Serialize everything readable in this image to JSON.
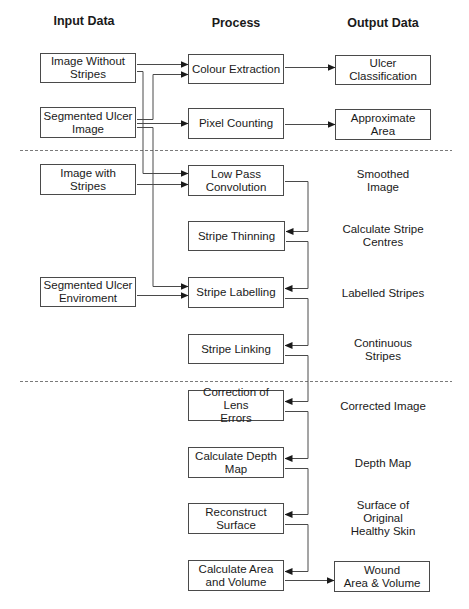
{
  "colors": {
    "line": "#4a4a4a",
    "text": "#1a1a1a",
    "dash": "#7a7a7a"
  },
  "headers": [
    {
      "id": "input",
      "text": "Input Data",
      "x": 84,
      "y": 22
    },
    {
      "id": "process",
      "text": "Process",
      "x": 236,
      "y": 24
    },
    {
      "id": "output",
      "text": "Output Data",
      "x": 383,
      "y": 24
    }
  ],
  "boxes": [
    {
      "id": "image-without-stripes",
      "col": "input",
      "text": "Image Without\nStripes",
      "x": 40,
      "y": 53,
      "w": 96,
      "h": 30
    },
    {
      "id": "segmented-ulcer-image",
      "col": "input",
      "text": "Segmented Ulcer\nImage",
      "x": 40,
      "y": 107,
      "w": 96,
      "h": 31
    },
    {
      "id": "image-with-stripes",
      "col": "input",
      "text": "Image with Stripes",
      "x": 40,
      "y": 164,
      "w": 96,
      "h": 31
    },
    {
      "id": "segmented-ulcer-enviroment",
      "col": "input",
      "text": "Segmented Ulcer\nEnviroment",
      "x": 40,
      "y": 277,
      "w": 96,
      "h": 30
    },
    {
      "id": "colour-extraction",
      "col": "process",
      "text": "Colour Extraction",
      "x": 188,
      "y": 54,
      "w": 96,
      "h": 30
    },
    {
      "id": "pixel-counting",
      "col": "process",
      "text": "Pixel Counting",
      "x": 188,
      "y": 108,
      "w": 96,
      "h": 31
    },
    {
      "id": "low-pass-convolution",
      "col": "process",
      "text": "Low Pass\nConvolution",
      "x": 188,
      "y": 165,
      "w": 96,
      "h": 31
    },
    {
      "id": "stripe-thinning",
      "col": "process",
      "text": "Stripe Thinning",
      "x": 188,
      "y": 221,
      "w": 97,
      "h": 30
    },
    {
      "id": "stripe-labelling",
      "col": "process",
      "text": "Stripe Labelling",
      "x": 188,
      "y": 277,
      "w": 96,
      "h": 31
    },
    {
      "id": "stripe-linking",
      "col": "process",
      "text": "Stripe Linking",
      "x": 188,
      "y": 334,
      "w": 96,
      "h": 30
    },
    {
      "id": "correction-of-lens-errors",
      "col": "process",
      "text": "Correction of Lens\nErrors",
      "x": 188,
      "y": 390,
      "w": 96,
      "h": 31
    },
    {
      "id": "calculate-depth-map",
      "col": "process",
      "text": "Calculate Depth\nMap",
      "x": 188,
      "y": 447,
      "w": 96,
      "h": 31
    },
    {
      "id": "reconstruct-surface",
      "col": "process",
      "text": "Reconstruct\nSurface",
      "x": 188,
      "y": 503,
      "w": 96,
      "h": 31
    },
    {
      "id": "calculate-area-and-volume",
      "col": "process",
      "text": "Calculate Area\nand Volume",
      "x": 188,
      "y": 560,
      "w": 96,
      "h": 31
    },
    {
      "id": "ulcer-classification",
      "col": "output",
      "text": "Ulcer Classification",
      "x": 335,
      "y": 55,
      "w": 96,
      "h": 30
    },
    {
      "id": "approximate-area",
      "col": "output",
      "text": "Approximate Area",
      "x": 335,
      "y": 109,
      "w": 96,
      "h": 31
    },
    {
      "id": "wound-area-volume",
      "col": "output",
      "text": "Wound\nArea & Volume",
      "x": 334,
      "y": 561,
      "w": 96,
      "h": 31
    }
  ],
  "labels": [
    {
      "id": "smoothed-image",
      "text": "Smoothed Image",
      "x": 383,
      "y": 181
    },
    {
      "id": "calculate-stripe-centres",
      "text": "Calculate Stripe\nCentres",
      "x": 383,
      "y": 236
    },
    {
      "id": "labelled-stripes",
      "text": "Labelled Stripes",
      "x": 383,
      "y": 293
    },
    {
      "id": "continuous-stripes",
      "text": "Continuous Stripes",
      "x": 383,
      "y": 350
    },
    {
      "id": "corrected-image",
      "text": "Corrected Image",
      "x": 383,
      "y": 406
    },
    {
      "id": "depth-map",
      "text": "Depth Map",
      "x": 383,
      "y": 463
    },
    {
      "id": "surface-of-original-healthy-skin",
      "text": "Surface of Original\nHealthy Skin",
      "x": 383,
      "y": 518
    }
  ],
  "dividers": [
    {
      "id": "divider-1",
      "x1": 20,
      "x2": 452,
      "y": 150
    },
    {
      "id": "divider-2",
      "x1": 20,
      "x2": 452,
      "y": 381
    }
  ],
  "connectors": [
    {
      "id": "iws-to-colour",
      "points": [
        [
          137,
          64
        ],
        [
          188,
          64
        ]
      ],
      "arrow": true
    },
    {
      "id": "iws-to-lowpass",
      "points": [
        [
          137,
          71
        ],
        [
          143,
          71
        ],
        [
          143,
          173
        ],
        [
          188,
          173
        ]
      ],
      "arrow": true
    },
    {
      "id": "sui-to-colour",
      "points": [
        [
          137,
          119
        ],
        [
          153,
          119
        ],
        [
          153,
          74
        ],
        [
          188,
          74
        ]
      ],
      "arrow": true
    },
    {
      "id": "sui-to-pixel",
      "points": [
        [
          137,
          123
        ],
        [
          188,
          123
        ]
      ],
      "arrow": true
    },
    {
      "id": "sui-to-labelling",
      "points": [
        [
          137,
          127
        ],
        [
          153,
          127
        ],
        [
          153,
          286
        ],
        [
          188,
          286
        ]
      ],
      "arrow": true
    },
    {
      "id": "iwstripes-to-lowpass",
      "points": [
        [
          137,
          184
        ],
        [
          188,
          184
        ]
      ],
      "arrow": true
    },
    {
      "id": "sue-to-labelling",
      "points": [
        [
          137,
          295
        ],
        [
          188,
          295
        ]
      ],
      "arrow": true
    },
    {
      "id": "colour-to-classification",
      "points": [
        [
          285,
          67
        ],
        [
          335,
          67
        ]
      ],
      "arrow": true
    },
    {
      "id": "pixel-to-area",
      "points": [
        [
          285,
          124
        ],
        [
          335,
          124
        ]
      ],
      "arrow": true
    },
    {
      "id": "lowpass-to-thinning",
      "points": [
        [
          285,
          181
        ],
        [
          308,
          181
        ],
        [
          308,
          231
        ],
        [
          286,
          231
        ]
      ],
      "arrow": true
    },
    {
      "id": "thinning-to-labelling",
      "points": [
        [
          286,
          241
        ],
        [
          308,
          241
        ],
        [
          308,
          288
        ],
        [
          285,
          288
        ]
      ],
      "arrow": true
    },
    {
      "id": "labelling-to-linking",
      "points": [
        [
          285,
          298
        ],
        [
          308,
          298
        ],
        [
          308,
          345
        ],
        [
          285,
          345
        ]
      ],
      "arrow": true
    },
    {
      "id": "linking-to-correction",
      "points": [
        [
          285,
          355
        ],
        [
          308,
          355
        ],
        [
          308,
          401
        ],
        [
          285,
          401
        ]
      ],
      "arrow": true
    },
    {
      "id": "correction-to-depth",
      "points": [
        [
          285,
          411
        ],
        [
          308,
          411
        ],
        [
          308,
          458
        ],
        [
          285,
          458
        ]
      ],
      "arrow": true
    },
    {
      "id": "depth-to-reconstruct",
      "points": [
        [
          285,
          468
        ],
        [
          308,
          468
        ],
        [
          308,
          514
        ],
        [
          285,
          514
        ]
      ],
      "arrow": true
    },
    {
      "id": "reconstruct-to-area",
      "points": [
        [
          285,
          524
        ],
        [
          308,
          524
        ],
        [
          308,
          571
        ],
        [
          285,
          571
        ]
      ],
      "arrow": true
    },
    {
      "id": "area-to-wound",
      "points": [
        [
          285,
          580
        ],
        [
          334,
          580
        ]
      ],
      "arrow": true
    }
  ]
}
